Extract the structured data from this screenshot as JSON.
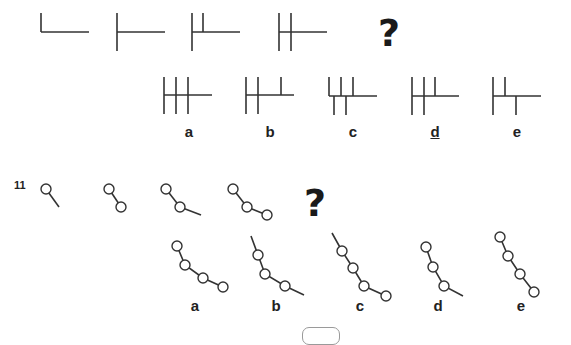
{
  "puzzle_10": {
    "question_mark": "?",
    "options": [
      {
        "label": "a",
        "underlined": false
      },
      {
        "label": "b",
        "underlined": false
      },
      {
        "label": "c",
        "underlined": false
      },
      {
        "label": "d",
        "underlined": true
      },
      {
        "label": "e",
        "underlined": false
      }
    ]
  },
  "puzzle_11": {
    "number": "11",
    "question_mark": "?",
    "options": [
      {
        "label": "a"
      },
      {
        "label": "b"
      },
      {
        "label": "c"
      },
      {
        "label": "d"
      },
      {
        "label": "e"
      }
    ]
  },
  "colors": {
    "stroke": "#333333",
    "background": "#ffffff"
  }
}
